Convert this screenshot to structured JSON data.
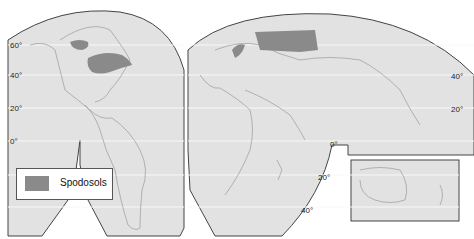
{
  "map": {
    "title": "Global distribution of Spodosols",
    "projection": "interrupted",
    "colors": {
      "land": "#e2e2e2",
      "ocean_bg": "#e2e2e2",
      "soil_fill": "#8a8a8a",
      "border": "#444444",
      "gridline": "#f8f8f8"
    },
    "latitude_labels": {
      "west": [
        "60°",
        "40°",
        "20°",
        "0°"
      ],
      "east": [
        "40°",
        "20°"
      ],
      "africa": [
        "0°",
        "20°",
        "40°"
      ]
    }
  },
  "legend": {
    "items": [
      {
        "label": "Spodosols",
        "color": "#8a8a8a"
      }
    ]
  }
}
